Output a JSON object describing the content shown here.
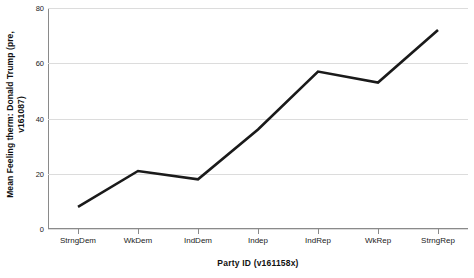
{
  "chart_data": {
    "type": "line",
    "title": "",
    "subtitle": "",
    "xlabel": "Party ID (v161158x)",
    "ylabel": "Mean Feeling therm: Donald Trump (pre, v161087)",
    "ylabel_line1": "Mean Feeling therm: Donald Trump (pre,",
    "ylabel_line2": "v161087)",
    "categories": [
      "StrngDem",
      "WkDem",
      "IndDem",
      "Indep",
      "IndRep",
      "WkRep",
      "StrngRep"
    ],
    "values": [
      8,
      21,
      18,
      36,
      57,
      53,
      72
    ],
    "series": [
      {
        "name": "Mean Feeling therm: Donald Trump (pre, v161087)",
        "values": [
          8,
          21,
          18,
          36,
          57,
          53,
          72
        ]
      }
    ],
    "ylim": [
      0,
      80
    ],
    "yticks": [
      0,
      20,
      40,
      60,
      80
    ],
    "ytick_labels": [
      "0",
      "20",
      "40",
      "60",
      "80"
    ],
    "grid": true,
    "grid_axis": "y",
    "legend": false,
    "legend_position": "none",
    "line_color": "#1a1a1a",
    "line_width": 2.6,
    "markers": false,
    "background_color": "#ffffff",
    "gridline_color": "#dcdcdc",
    "axis_color": "#8a8a8a"
  }
}
